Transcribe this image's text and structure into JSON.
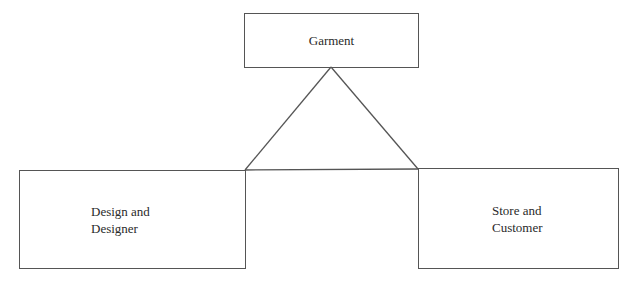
{
  "diagram": {
    "type": "triangle-relationship",
    "nodes": [
      {
        "id": "garment",
        "label_lines": [
          "Garment"
        ]
      },
      {
        "id": "design",
        "label_lines": [
          "Design and",
          "Designer"
        ]
      },
      {
        "id": "store",
        "label_lines": [
          "Store and",
          "Customer"
        ]
      }
    ],
    "edges": [
      {
        "from": "garment",
        "to": "design"
      },
      {
        "from": "garment",
        "to": "store"
      },
      {
        "from": "design",
        "to": "store"
      }
    ],
    "colors": {
      "stroke": "#555555",
      "text": "#2a2a2a",
      "background": "#ffffff"
    }
  }
}
